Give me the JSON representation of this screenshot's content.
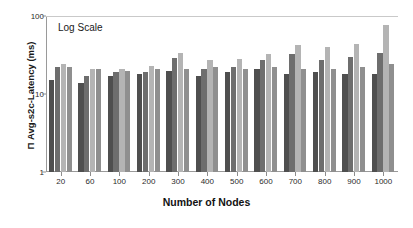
{
  "chart_data": {
    "type": "bar",
    "title": "",
    "annotation": "Log Scale",
    "xlabel": "Number of Nodes",
    "ylabel": "Π Avg-s2c-Latency (ms)",
    "yscale": "log",
    "ylim": [
      1,
      100
    ],
    "yticks": [
      1,
      10,
      100
    ],
    "ytick_labels": [
      "1",
      "10",
      "100"
    ],
    "grid": false,
    "legend": "none",
    "categories": [
      "20",
      "60",
      "100",
      "200",
      "300",
      "400",
      "500",
      "600",
      "700",
      "800",
      "900",
      "1000"
    ],
    "series": [
      {
        "name": "series-1",
        "color": "#4f4f4f",
        "values": [
          15,
          14,
          17,
          18,
          20,
          17,
          19,
          21,
          18,
          19,
          18,
          18
        ]
      },
      {
        "name": "series-2",
        "color": "#6e6e6e",
        "values": [
          22,
          17,
          19,
          19,
          29,
          21,
          22,
          27,
          33,
          27,
          30,
          34
        ]
      },
      {
        "name": "series-3",
        "color": "#b4b4b4",
        "values": [
          24,
          21,
          21,
          23,
          34,
          27,
          28,
          33,
          42,
          40,
          44,
          76
        ]
      },
      {
        "name": "series-4",
        "color": "#8f8f8f",
        "values": [
          22,
          21,
          20,
          21,
          21,
          22,
          21,
          22,
          21,
          21,
          22,
          24
        ]
      }
    ],
    "axis_color": "#9a9a9a",
    "background": "#ffffff"
  }
}
